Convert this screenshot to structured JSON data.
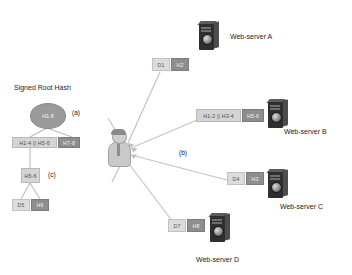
{
  "diagram": {
    "title": "Signed Root Hash",
    "annotations": {
      "a": "(a)",
      "b": "(b)",
      "c": "(c)"
    },
    "merkle_tree": {
      "root": "H1-8",
      "level2_left": "H1-4 || H5-6",
      "level2_right": "H7-8",
      "level3": "H5-6",
      "leaf_data": "D5",
      "leaf_hash": "H6"
    },
    "client": {
      "name": "client-user"
    },
    "servers": [
      {
        "id": "a",
        "label": "Web-server A",
        "payload_data": "D1",
        "payload_hash": "H2"
      },
      {
        "id": "b",
        "label": "Web-server B",
        "payload_data": "H1-2 || H3-4",
        "payload_hash": "H5-6"
      },
      {
        "id": "c",
        "label": "Web-server C",
        "payload_data": "D4",
        "payload_hash": "H3"
      },
      {
        "id": "d",
        "label": "Web-server D",
        "payload_data": "D7",
        "payload_hash": "H8"
      }
    ],
    "colors": {
      "node_dark": "#8e8e8e",
      "node_light": "#dcdcdc",
      "root_fill": "#9a9a9a",
      "edge": "#b5b5b5",
      "server_body": "#2f2f2f",
      "text": "#1b1b1b"
    }
  }
}
